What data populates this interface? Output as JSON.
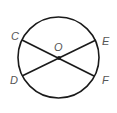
{
  "diagram": {
    "type": "circle-with-chords",
    "circle": {
      "cx": 58.5,
      "cy": 57.5,
      "r": 40.5
    },
    "center": {
      "label": "O",
      "x": 59,
      "y": 58
    },
    "points": [
      {
        "label": "C",
        "x": 22,
        "y": 40,
        "label_x": 11,
        "label_y": 40
      },
      {
        "label": "D",
        "x": 22,
        "y": 76,
        "label_x": 10,
        "label_y": 84
      },
      {
        "label": "E",
        "x": 96,
        "y": 40,
        "label_x": 102,
        "label_y": 45
      },
      {
        "label": "F",
        "x": 94,
        "y": 76,
        "label_x": 102,
        "label_y": 84
      }
    ],
    "segments": [
      {
        "from": "C",
        "to": "F"
      },
      {
        "from": "D",
        "to": "E"
      }
    ],
    "colors": {
      "stroke": "#1a1a1a",
      "label": "#555555"
    }
  }
}
